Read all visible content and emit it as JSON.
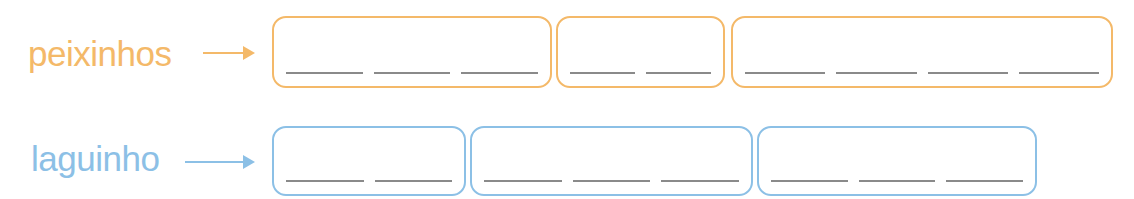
{
  "colors": {
    "orange": "#F4B969",
    "blue": "#8CC0E6",
    "blank_line": "#8a8a8a"
  },
  "rows": [
    {
      "word": "peixinhos",
      "color": "orange",
      "arrow": "arrow-right",
      "syllable_boxes": [
        {
          "blanks": 3
        },
        {
          "blanks": 2
        },
        {
          "blanks": 4
        }
      ]
    },
    {
      "word": "laguinho",
      "color": "blue",
      "arrow": "arrow-right",
      "syllable_boxes": [
        {
          "blanks": 2
        },
        {
          "blanks": 3
        },
        {
          "blanks": 3
        }
      ]
    }
  ]
}
